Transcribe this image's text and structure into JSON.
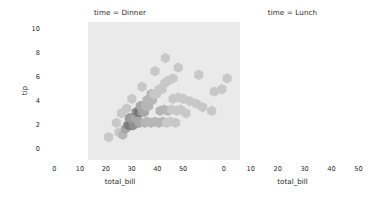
{
  "figure": {
    "bg": "#ffffff",
    "panel_bg": "#eaeaea",
    "text_color": "#2a2a2a",
    "cmap_dark": "#707070",
    "cmap_light": "#eaeaea"
  },
  "chart_data": {
    "type": "heatmap",
    "plot_kind": "hexbin",
    "title": "",
    "xlabel": "total_bill",
    "ylabel": "tip",
    "facet_variable": "time",
    "grid": false,
    "legend": "none",
    "xlim": [
      -4,
      55
    ],
    "ylim": [
      -0.9,
      10.6
    ],
    "xticks": [
      0,
      10,
      20,
      30,
      40,
      50
    ],
    "xticklabels": [
      "0",
      "10",
      "20",
      "30",
      "40",
      "50"
    ],
    "yticks": [
      0,
      2,
      4,
      6,
      8,
      10
    ],
    "yticklabels": [
      "0",
      "2",
      "4",
      "6",
      "8",
      "10"
    ],
    "colormap": "Greys",
    "panels": [
      {
        "title": "time = Dinner",
        "facet_value": "Dinner",
        "n_points": 176,
        "bins": [
          {
            "x": 8.0,
            "y": 1.4,
            "c": 1
          },
          {
            "x": 9.5,
            "y": 1.2,
            "c": 2
          },
          {
            "x": 10.5,
            "y": 1.7,
            "c": 3
          },
          {
            "x": 11.5,
            "y": 2.0,
            "c": 6
          },
          {
            "x": 12.6,
            "y": 2.0,
            "c": 7
          },
          {
            "x": 13.6,
            "y": 2.0,
            "c": 5
          },
          {
            "x": 12.0,
            "y": 2.6,
            "c": 4
          },
          {
            "x": 13.1,
            "y": 2.6,
            "c": 4
          },
          {
            "x": 14.2,
            "y": 2.6,
            "c": 3
          },
          {
            "x": 15.2,
            "y": 2.6,
            "c": 3
          },
          {
            "x": 14.7,
            "y": 3.1,
            "c": 5
          },
          {
            "x": 15.8,
            "y": 3.1,
            "c": 8
          },
          {
            "x": 16.8,
            "y": 3.1,
            "c": 4
          },
          {
            "x": 17.9,
            "y": 3.1,
            "c": 3
          },
          {
            "x": 16.3,
            "y": 3.6,
            "c": 3
          },
          {
            "x": 17.4,
            "y": 3.6,
            "c": 3
          },
          {
            "x": 18.4,
            "y": 3.6,
            "c": 2
          },
          {
            "x": 19.5,
            "y": 3.6,
            "c": 2
          },
          {
            "x": 18.9,
            "y": 4.1,
            "c": 2
          },
          {
            "x": 20.0,
            "y": 4.1,
            "c": 2
          },
          {
            "x": 21.0,
            "y": 4.1,
            "c": 2
          },
          {
            "x": 20.5,
            "y": 4.6,
            "c": 2
          },
          {
            "x": 21.6,
            "y": 4.6,
            "c": 1
          },
          {
            "x": 22.6,
            "y": 4.6,
            "c": 1
          },
          {
            "x": 23.7,
            "y": 5.0,
            "c": 1
          },
          {
            "x": 24.7,
            "y": 5.0,
            "c": 1
          },
          {
            "x": 25.8,
            "y": 5.5,
            "c": 1
          },
          {
            "x": 27.0,
            "y": 5.7,
            "c": 1
          },
          {
            "x": 29.0,
            "y": 5.9,
            "c": 1
          },
          {
            "x": 16.0,
            "y": 2.2,
            "c": 3
          },
          {
            "x": 18.0,
            "y": 2.2,
            "c": 2
          },
          {
            "x": 19.0,
            "y": 2.3,
            "c": 2
          },
          {
            "x": 20.5,
            "y": 2.2,
            "c": 2
          },
          {
            "x": 22.0,
            "y": 2.3,
            "c": 2
          },
          {
            "x": 23.5,
            "y": 2.2,
            "c": 2
          },
          {
            "x": 25.0,
            "y": 2.3,
            "c": 2
          },
          {
            "x": 26.5,
            "y": 2.2,
            "c": 1
          },
          {
            "x": 28.0,
            "y": 2.3,
            "c": 1
          },
          {
            "x": 30.0,
            "y": 2.2,
            "c": 1
          },
          {
            "x": 24.0,
            "y": 3.2,
            "c": 2
          },
          {
            "x": 25.5,
            "y": 3.3,
            "c": 2
          },
          {
            "x": 27.0,
            "y": 3.2,
            "c": 2
          },
          {
            "x": 28.5,
            "y": 3.3,
            "c": 1
          },
          {
            "x": 30.5,
            "y": 3.2,
            "c": 1
          },
          {
            "x": 32.0,
            "y": 3.3,
            "c": 1
          },
          {
            "x": 34.0,
            "y": 3.0,
            "c": 1
          },
          {
            "x": 29.0,
            "y": 4.2,
            "c": 1
          },
          {
            "x": 31.0,
            "y": 4.3,
            "c": 1
          },
          {
            "x": 33.0,
            "y": 4.2,
            "c": 1
          },
          {
            "x": 35.5,
            "y": 4.0,
            "c": 1
          },
          {
            "x": 38.0,
            "y": 3.8,
            "c": 1
          },
          {
            "x": 40.5,
            "y": 3.5,
            "c": 1
          },
          {
            "x": 44.0,
            "y": 3.2,
            "c": 1
          },
          {
            "x": 48.0,
            "y": 5.0,
            "c": 1
          },
          {
            "x": 50.0,
            "y": 5.9,
            "c": 1
          },
          {
            "x": 7.0,
            "y": 2.2,
            "c": 1
          },
          {
            "x": 9.0,
            "y": 3.0,
            "c": 1
          },
          {
            "x": 11.0,
            "y": 3.4,
            "c": 1
          },
          {
            "x": 13.0,
            "y": 4.2,
            "c": 1
          },
          {
            "x": 17.0,
            "y": 5.2,
            "c": 1
          },
          {
            "x": 22.0,
            "y": 6.5,
            "c": 1
          },
          {
            "x": 26.0,
            "y": 7.6,
            "c": 1
          },
          {
            "x": 31.0,
            "y": 6.8,
            "c": 1
          },
          {
            "x": 4.0,
            "y": 1.0,
            "c": 1
          },
          {
            "x": 39.0,
            "y": 6.2,
            "c": 1
          },
          {
            "x": 45.0,
            "y": 4.8,
            "c": 1
          }
        ]
      },
      {
        "title": "time = Lunch",
        "facet_value": "Lunch",
        "n_points": 68,
        "bins": [
          {
            "x": 8.5,
            "y": 1.8,
            "c": 2
          },
          {
            "x": 10.0,
            "y": 1.9,
            "c": 3
          },
          {
            "x": 11.2,
            "y": 2.0,
            "c": 6
          },
          {
            "x": 12.4,
            "y": 2.0,
            "c": 4
          },
          {
            "x": 13.6,
            "y": 2.0,
            "c": 3
          },
          {
            "x": 11.8,
            "y": 2.6,
            "c": 2
          },
          {
            "x": 13.0,
            "y": 2.6,
            "c": 2
          },
          {
            "x": 14.2,
            "y": 2.6,
            "c": 2
          },
          {
            "x": 14.6,
            "y": 3.1,
            "c": 2
          },
          {
            "x": 15.8,
            "y": 3.1,
            "c": 2
          },
          {
            "x": 17.0,
            "y": 3.0,
            "c": 2
          },
          {
            "x": 12.5,
            "y": 1.4,
            "c": 2
          },
          {
            "x": 14.0,
            "y": 1.4,
            "c": 2
          },
          {
            "x": 16.0,
            "y": 2.2,
            "c": 2
          },
          {
            "x": 18.0,
            "y": 2.4,
            "c": 1
          },
          {
            "x": 20.0,
            "y": 2.6,
            "c": 1
          },
          {
            "x": 22.0,
            "y": 3.0,
            "c": 1
          },
          {
            "x": 19.0,
            "y": 3.6,
            "c": 1
          },
          {
            "x": 21.0,
            "y": 3.4,
            "c": 1
          },
          {
            "x": 25.0,
            "y": 3.4,
            "c": 1
          },
          {
            "x": 28.0,
            "y": 3.6,
            "c": 1
          },
          {
            "x": 30.0,
            "y": 4.2,
            "c": 1
          },
          {
            "x": 33.0,
            "y": 4.6,
            "c": 1
          },
          {
            "x": 36.0,
            "y": 3.6,
            "c": 1
          },
          {
            "x": 41.0,
            "y": 3.4,
            "c": 1
          },
          {
            "x": 7.0,
            "y": 1.2,
            "c": 1
          },
          {
            "x": 9.0,
            "y": 1.0,
            "c": 1
          },
          {
            "x": 16.5,
            "y": 1.4,
            "c": 1
          },
          {
            "x": 17.5,
            "y": 4.0,
            "c": 1
          },
          {
            "x": 24.0,
            "y": 2.2,
            "c": 1
          },
          {
            "x": 27.0,
            "y": 2.6,
            "c": 1
          },
          {
            "x": 32.0,
            "y": 2.8,
            "c": 1
          },
          {
            "x": 5.5,
            "y": 1.0,
            "c": 1
          },
          {
            "x": 43.0,
            "y": 2.6,
            "c": 1
          }
        ]
      }
    ]
  }
}
